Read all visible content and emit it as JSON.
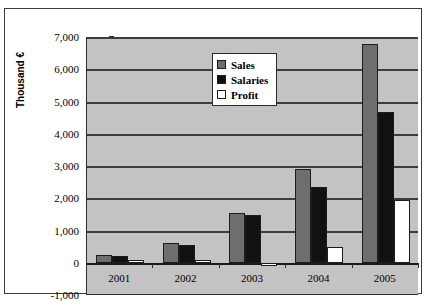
{
  "chart_data": {
    "type": "bar",
    "title": "",
    "subtitle": "",
    "xlabel": "",
    "ylabel": "Thousand €",
    "categories": [
      "2001",
      "2002",
      "2003",
      "2004",
      "2005"
    ],
    "series": [
      {
        "name": "Sales",
        "color": "#6e6e6e",
        "values": [
          250,
          620,
          1530,
          2910,
          6780
        ]
      },
      {
        "name": "Salaries",
        "color": "#111111",
        "values": [
          200,
          550,
          1470,
          2350,
          4670
        ]
      },
      {
        "name": "Profit",
        "color": "#ffffff",
        "values": [
          10,
          20,
          -50,
          480,
          1950
        ]
      }
    ],
    "ylim": [
      -1000,
      7000
    ],
    "ytick_values": [
      7000,
      6000,
      5000,
      4000,
      3000,
      2000,
      1000,
      0,
      -1000
    ],
    "ytick_labels": [
      "7,000",
      "6,000",
      "5,000",
      "4,000",
      "3,000",
      "2,000",
      "1,000",
      "0",
      "-1,000"
    ],
    "grid": true,
    "legend_position": "top-center",
    "plot_background": "#c3c3c3",
    "frame_color": "#3a3a3a"
  },
  "legend": {
    "items": [
      {
        "label": "Sales"
      },
      {
        "label": "Salaries"
      },
      {
        "label": "Profit"
      }
    ]
  }
}
